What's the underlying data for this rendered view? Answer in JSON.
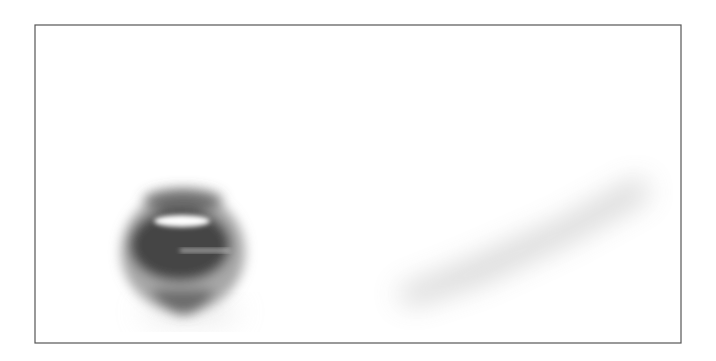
{
  "image": {
    "subject": "Newton's cradle",
    "description": "Row of chrome steel balls hanging on strings; the leftmost ball is in motion (motion blurred) swinging toward the row",
    "frame": {
      "x": 35,
      "y": 25,
      "width": 646,
      "height": 318,
      "border_color": "#555555"
    },
    "palette": {
      "background": "#ffffff",
      "steel_dark": "#2a2a2a",
      "steel_mid": "#6e6e6e",
      "steel_light": "#b5b5b5",
      "string": "#7a7a7a"
    },
    "moving_ball": {
      "cx": 183,
      "cy": 252,
      "r": 62,
      "blurred": true
    },
    "balls": [
      {
        "cx": 365,
        "cy": 198,
        "r": 52,
        "hook_y": 140,
        "string_tops": [
          339,
          393
        ]
      },
      {
        "cx": 430,
        "cy": 165,
        "r": 45,
        "hook_y": 116,
        "string_tops": [
          409,
          455
        ]
      },
      {
        "cx": 484,
        "cy": 144,
        "r": 40,
        "hook_y": 98,
        "string_tops": [
          469,
          505
        ]
      },
      {
        "cx": 531,
        "cy": 124,
        "r": 37,
        "hook_y": 83,
        "string_tops": [
          521,
          548
        ]
      },
      {
        "cx": 573,
        "cy": 105,
        "r": 35,
        "hook_y": 67,
        "string_tops": [
          566,
          585
        ]
      },
      {
        "cx": 611,
        "cy": 86,
        "r": 33,
        "hook_y": 51,
        "string_tops": [
          606,
          617
        ]
      }
    ]
  }
}
